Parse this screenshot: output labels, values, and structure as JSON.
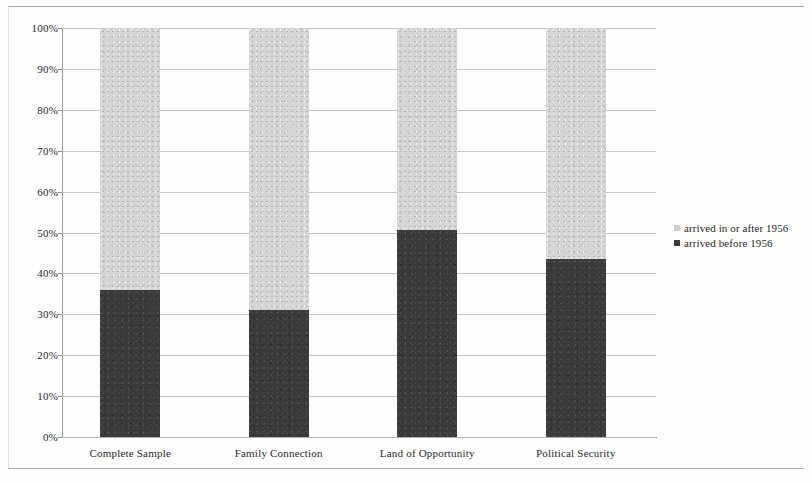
{
  "chart_data": {
    "type": "bar",
    "subtype": "stacked-100-percent",
    "title": "",
    "xlabel": "",
    "ylabel": "",
    "ylim": [
      0,
      100
    ],
    "y_unit": "%",
    "grid": true,
    "legend_position": "right",
    "categories": [
      "Complete Sample",
      "Family Connection",
      "Land of Opportunity",
      "Political Security"
    ],
    "y_ticks": [
      "0%",
      "10%",
      "20%",
      "30%",
      "40%",
      "50%",
      "60%",
      "70%",
      "80%",
      "90%",
      "100%"
    ],
    "series": [
      {
        "name": "arrived before 1956",
        "color": "#3a3a3a",
        "values": [
          36,
          31,
          50.5,
          43.5
        ]
      },
      {
        "name": "arrived in or after 1956",
        "color": "#d6d6d6",
        "values": [
          64,
          69,
          49.5,
          56.5
        ]
      }
    ]
  },
  "legend": {
    "entries": [
      {
        "label": "arrived in or after 1956",
        "swatch": "light"
      },
      {
        "label": "arrived before 1956",
        "swatch": "dark"
      }
    ]
  }
}
